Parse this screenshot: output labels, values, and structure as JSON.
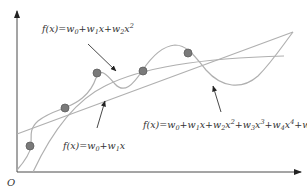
{
  "diagram": {
    "origin_label": "O",
    "colors": {
      "axis": "#4a4a4a",
      "curve": "#b0b0b0",
      "point": "#7a7a7a",
      "pointer": "#333333",
      "text": "#333333"
    },
    "models": [
      {
        "id": "linear",
        "degree": 1,
        "label_parts": [
          "f(x)=w",
          "0",
          "+w",
          "1",
          "x"
        ]
      },
      {
        "id": "quadratic",
        "degree": 2,
        "label_parts": [
          "f(x)=w",
          "0",
          "+w",
          "1",
          "x+w",
          "2",
          "x",
          "2"
        ]
      },
      {
        "id": "quintic",
        "degree": 5,
        "label_parts": [
          "f(x)=w",
          "0",
          "+w",
          "1",
          "x+w",
          "2",
          "x",
          "2",
          "+w",
          "3",
          "x",
          "3",
          "+w",
          "4",
          "x",
          "4",
          "+w",
          "5",
          "x",
          "5"
        ]
      }
    ],
    "data_points_count": 5
  }
}
